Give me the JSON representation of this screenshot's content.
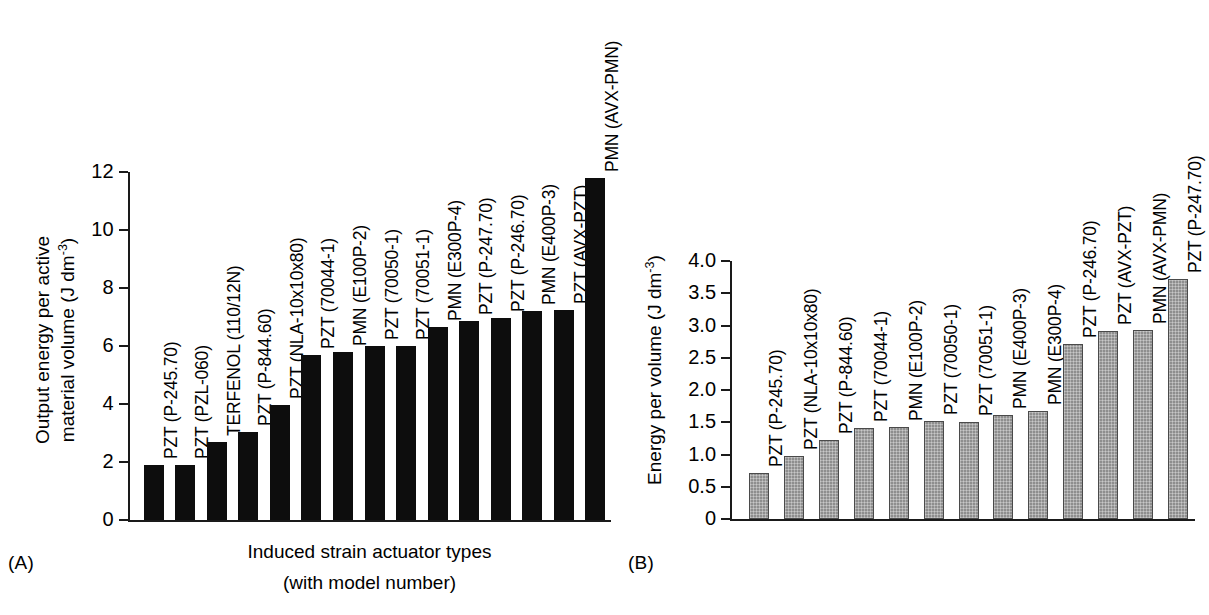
{
  "figure": {
    "background": "#ffffff",
    "panels": [
      {
        "tag": "(A)",
        "bar_color": "#0d0d0d",
        "style": "solid"
      },
      {
        "tag": "(B)",
        "bar_color": "#8e8e8e",
        "style": "hatch"
      }
    ]
  },
  "chart_data": [
    {
      "type": "bar",
      "panel": "(A)",
      "title": "",
      "xlabel_line1": "Induced strain actuator types",
      "xlabel_line2": "(with model number)",
      "ylabel_line1": "Output energy per active",
      "ylabel_line2": "material volume (J dm",
      "ylabel_exp": "-3",
      "ylabel_line2_tail": ")",
      "ylim": [
        0,
        12
      ],
      "yticks": [
        0,
        2,
        4,
        6,
        8,
        10,
        12
      ],
      "ytick_labels": [
        "0",
        "2",
        "4",
        "6",
        "8",
        "10",
        "12"
      ],
      "grid": false,
      "legend": "none",
      "categories": [
        "PZT (P-245.70)",
        "PZT (PZL-060)",
        "TERFENOL (110/12N)",
        "PZT (P-844.60)",
        "PZT (NLA-10x10x80)",
        "PZT (70044-1)",
        "PMN (E100P-2)",
        "PZT (70050-1)",
        "PZT (70051-1)",
        "PMN (E300P-4)",
        "PZT (P-247.70)",
        "PZT (P-246.70)",
        "PMN (E400P-3)",
        "PZT (AVX-PZT)",
        "PMN (AVX-PMN)"
      ],
      "values": [
        1.9,
        1.9,
        2.7,
        3.05,
        3.95,
        5.7,
        5.8,
        6.0,
        6.0,
        6.65,
        6.85,
        6.95,
        7.2,
        7.25,
        11.8
      ]
    },
    {
      "type": "bar",
      "panel": "(B)",
      "title": "",
      "xlabel_line1": "",
      "xlabel_line2": "",
      "ylabel_line1": "Energy per volume (J dm",
      "ylabel_exp": "-3",
      "ylabel_line2_tail": ")",
      "ylim": [
        0,
        4.0
      ],
      "yticks": [
        0,
        0.5,
        1.0,
        1.5,
        2.0,
        2.5,
        3.0,
        3.5,
        4.0
      ],
      "ytick_labels": [
        "0",
        "0.5",
        "1.0",
        "1.5",
        "2.0",
        "2.5",
        "3.0",
        "3.5",
        "4.0"
      ],
      "grid": false,
      "legend": "none",
      "categories": [
        "PZT (P-245.70)",
        "PZT (NLA-10x10x80)",
        "PZT (P-844.60)",
        "PZT (70044-1)",
        "PMN (E100P-2)",
        "PZT (70050-1)",
        "PZT (70051-1)",
        "PMN (E400P-3)",
        "PMN (E300P-4)",
        "PZT (P-246.70)",
        "PZT (AVX-PZT)",
        "PMN (AVX-PMN)",
        "PZT (P-247.70)"
      ],
      "values": [
        0.72,
        0.98,
        1.22,
        1.41,
        1.43,
        1.52,
        1.5,
        1.62,
        1.67,
        2.72,
        2.92,
        2.93,
        3.72
      ]
    }
  ]
}
